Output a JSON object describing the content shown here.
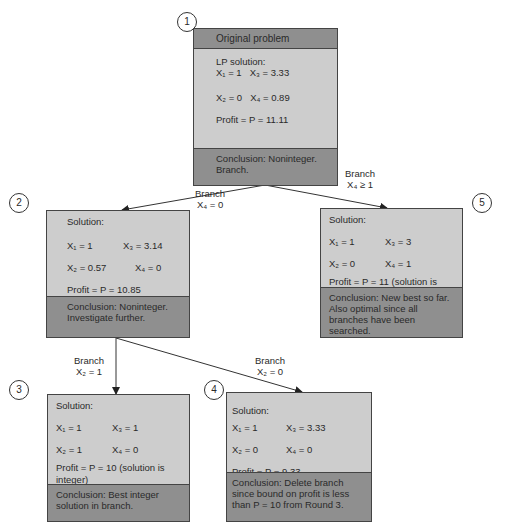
{
  "nodes": [
    {
      "number": "1",
      "header": "Original problem",
      "solution_label": "LP solution:",
      "x1": "X₁ = 1",
      "x3": "X₃ = 3.33",
      "x2": "X₂ = 0",
      "x4": "X₄ = 0.89",
      "profit": "Profit = P = 11.11",
      "conclusion": "Conclusion: Noninteger. Branch."
    },
    {
      "number": "2",
      "solution_label": "Solution:",
      "x1": "X₁ = 1",
      "x3": "X₃ = 3.14",
      "x2": "X₂ = 0.57",
      "x4": "X₄ = 0",
      "profit": "Profit = P = 10.85",
      "conclusion": "Conclusion: Noninteger. Investigate further."
    },
    {
      "number": "3",
      "solution_label": "Solution:",
      "x1": "X₁ = 1",
      "x3": "X₃ = 1",
      "x2": "X₂ = 1",
      "x4": "X₄ = 0",
      "profit": "Profit = P = 10 (solution is integer)",
      "conclusion": "Conclusion: Best integer solution in branch."
    },
    {
      "number": "4",
      "solution_label": "Solution:",
      "x1": "X₁ = 1",
      "x3": "X₃ = 3.33",
      "x2": "X₂ = 0",
      "x4": "X₄ = 0",
      "profit": "Profit = P = 9.33",
      "conclusion": "Conclusion: Delete branch since bound on profit is less than P = 10 from Round 3."
    },
    {
      "number": "5",
      "solution_label": "Solution:",
      "x1": "X₁ = 1",
      "x3": "X₃ = 3",
      "x2": "X₂ = 0",
      "x4": "X₄ = 1",
      "profit": "Profit = P = 11 (solution is integer)",
      "conclusion": "Conclusion: New best so far. Also optimal since all branches have been searched."
    }
  ],
  "branches": [
    {
      "word": "Branch",
      "cond": "X₄ = 0"
    },
    {
      "word": "Branch",
      "cond": "X₄ ≥ 1"
    },
    {
      "word": "Branch",
      "cond": "X₂ = 1"
    },
    {
      "word": "Branch",
      "cond": "X₂ = 0"
    }
  ]
}
